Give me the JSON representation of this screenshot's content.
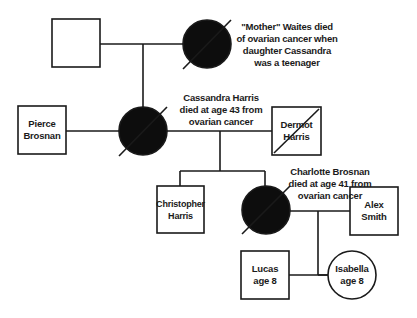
{
  "diagram": {
    "type": "pedigree",
    "colors": {
      "line": "#1a1a1a",
      "affected_fill": "#0d0d0d",
      "background": "#ffffff"
    },
    "people": [
      {
        "id": "waites_father",
        "sex": "male",
        "affected": false,
        "deceased": false,
        "name_lines": []
      },
      {
        "id": "mother_waites",
        "sex": "female",
        "affected": true,
        "deceased": true,
        "note_lines": [
          "\"Mother\" Waites died",
          "of ovarian cancer when",
          "daughter Cassandra",
          "was a teenager"
        ]
      },
      {
        "id": "pierce_brosnan",
        "sex": "male",
        "affected": false,
        "deceased": false,
        "name_lines": [
          "Pierce",
          "Brosnan"
        ]
      },
      {
        "id": "cassandra_harris",
        "sex": "female",
        "affected": true,
        "deceased": true,
        "note_lines": [
          "Cassandra Harris",
          "died at age 43 from",
          "ovarian cancer"
        ]
      },
      {
        "id": "dermot_harris",
        "sex": "male",
        "affected": false,
        "deceased": true,
        "name_lines": [
          "Dermot",
          "Harris"
        ]
      },
      {
        "id": "christopher_harris",
        "sex": "male",
        "affected": false,
        "deceased": false,
        "name_lines": [
          "Christopher",
          "Harris"
        ]
      },
      {
        "id": "charlotte_brosnan",
        "sex": "female",
        "affected": true,
        "deceased": true,
        "note_lines": [
          "Charlotte Brosnan",
          "died at age 41 from",
          "ovarian cancer"
        ]
      },
      {
        "id": "alex_smith",
        "sex": "male",
        "affected": false,
        "deceased": false,
        "name_lines": [
          "Alex",
          "Smith"
        ]
      },
      {
        "id": "lucas",
        "sex": "male",
        "affected": false,
        "deceased": false,
        "name_lines": [
          "Lucas",
          "age 8"
        ]
      },
      {
        "id": "isabella",
        "sex": "female",
        "affected": false,
        "deceased": false,
        "name_lines": [
          "Isabella",
          "age 8"
        ]
      }
    ],
    "relationships": [
      {
        "partners": [
          "waites_father",
          "mother_waites"
        ],
        "children": [
          "cassandra_harris"
        ]
      },
      {
        "partners": [
          "pierce_brosnan",
          "cassandra_harris"
        ],
        "children": []
      },
      {
        "partners": [
          "cassandra_harris",
          "dermot_harris"
        ],
        "children": [
          "christopher_harris",
          "charlotte_brosnan"
        ]
      },
      {
        "partners": [
          "charlotte_brosnan",
          "alex_smith"
        ],
        "children": [
          "lucas",
          "isabella"
        ]
      }
    ]
  }
}
